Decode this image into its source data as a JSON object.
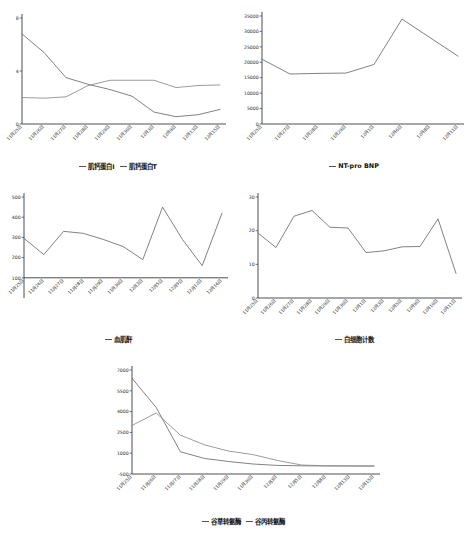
{
  "figure": {
    "background": "#ffffff",
    "line_color_primary": "#6b6b6b",
    "line_color_secondary": "#8a8a8a",
    "axis_color": "#3a3a3a"
  },
  "charts": [
    {
      "id": "troponin",
      "type": "line",
      "title": "",
      "xlabel": "",
      "ylabel": "",
      "grid": false,
      "legend_position": "bottom",
      "ylim": [
        0,
        8
      ],
      "yticks": [
        0,
        4,
        8
      ],
      "ytick_labels": [
        "0",
        "4",
        "8"
      ],
      "categories": [
        "11月25日",
        "11月26日",
        "11月27日",
        "11月28日",
        "11月29日",
        "11月30日",
        "12月3日",
        "12月9日",
        "12月13日",
        "12月15日"
      ],
      "series": [
        {
          "name": "肌钙蛋白I",
          "values": [
            6.8,
            5.4,
            3.5,
            3.0,
            2.6,
            2.1,
            0.9,
            0.55,
            0.7,
            1.1
          ]
        },
        {
          "name": "肌钙蛋白T",
          "values": [
            2.0,
            1.95,
            2.05,
            2.9,
            3.3,
            3.3,
            3.3,
            2.75,
            2.9,
            2.95
          ]
        }
      ]
    },
    {
      "id": "nt-pro-bnp",
      "type": "line",
      "title": "",
      "xlabel": "",
      "ylabel": "",
      "grid": false,
      "legend_position": "bottom",
      "ylim": [
        0,
        35000
      ],
      "yticks": [
        0,
        5000,
        10000,
        15000,
        20000,
        25000,
        30000,
        35000
      ],
      "ytick_labels": [
        "0",
        "5000",
        "10000",
        "15000",
        "20000",
        "25000",
        "30000",
        "35000"
      ],
      "categories": [
        "11月25日",
        "11月27日",
        "11月28日",
        "11月29日",
        "12月1日",
        "12月6日",
        "12月8日",
        "12月11日"
      ],
      "series": [
        {
          "name": "NT-pro BNP",
          "values": [
            21000,
            16200,
            16400,
            16500,
            19300,
            34000,
            28000,
            22000
          ]
        }
      ]
    },
    {
      "id": "creatinine",
      "type": "line",
      "title": "",
      "xlabel": "",
      "ylabel": "",
      "grid": false,
      "legend_position": "bottom",
      "ylim": [
        0,
        500
      ],
      "yticks": [
        100,
        200,
        300,
        400,
        500
      ],
      "ytick_labels": [
        "100",
        "200",
        "300",
        "400",
        "500"
      ],
      "categories": [
        "11月25日",
        "11月26日",
        "11月27日",
        "11月28日",
        "11月29日",
        "11月30日",
        "12月3日",
        "12月5日",
        "12月9日",
        "12月12日",
        "12月16日"
      ],
      "series": [
        {
          "name": "血肌酐",
          "values": [
            295,
            215,
            330,
            320,
            290,
            255,
            190,
            450,
            290,
            160,
            420
          ]
        }
      ]
    },
    {
      "id": "wbc",
      "type": "line",
      "title": "",
      "xlabel": "",
      "ylabel": "",
      "grid": false,
      "legend_position": "bottom",
      "ylim": [
        0,
        30
      ],
      "yticks": [
        0,
        10,
        20,
        30
      ],
      "ytick_labels": [
        "0",
        "10",
        "20",
        "30"
      ],
      "categories": [
        "11月25日",
        "11月26日",
        "11月27日",
        "11月28日",
        "11月29日",
        "11月30日",
        "12月1日",
        "12月3日",
        "12月5日",
        "12月9日",
        "12月10日",
        "12月11日"
      ],
      "series": [
        {
          "name": "白细胞计数",
          "values": [
            19.3,
            15.0,
            24.3,
            26.0,
            21.0,
            20.8,
            13.5,
            14.0,
            15.2,
            15.3,
            23.5,
            7.3
          ]
        }
      ]
    },
    {
      "id": "transaminase",
      "type": "line",
      "title": "",
      "xlabel": "",
      "ylabel": "",
      "grid": false,
      "legend_position": "bottom",
      "ylim": [
        -500,
        7000
      ],
      "yticks": [
        -500,
        1000,
        2500,
        4000,
        5500,
        7000
      ],
      "ytick_labels": [
        "-500",
        "1000",
        "2500",
        "4000",
        "5500",
        "7000"
      ],
      "categories": [
        "11月25日",
        "11月26日",
        "11月27日",
        "11月28日",
        "11月29日",
        "11月30日",
        "12月3日",
        "12月5日",
        "12月8日",
        "12月13日",
        "12月15日"
      ],
      "series": [
        {
          "name": "谷草转氨酶",
          "values": [
            6400,
            4300,
            1100,
            620,
            400,
            220,
            120,
            90,
            80,
            75,
            70
          ]
        },
        {
          "name": "谷丙转氨酶",
          "values": [
            3000,
            3900,
            2300,
            1600,
            1150,
            900,
            480,
            150,
            95,
            85,
            80
          ]
        }
      ]
    }
  ]
}
